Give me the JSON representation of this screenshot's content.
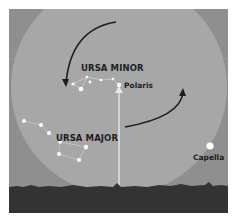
{
  "diagram": {
    "labels": {
      "ursa_minor": "URSA MINOR",
      "ursa_major": "URSA MAJOR",
      "polaris": "Polaris",
      "capella": "Capella"
    },
    "arrows": [
      {
        "name": "counterclockwise-arrow-upper-left",
        "direction": "counterclockwise"
      },
      {
        "name": "counterclockwise-arrow-lower-right",
        "direction": "counterclockwise"
      }
    ],
    "colors": {
      "sky": "#8f8f8f",
      "circumpolar_circle": "#a7a7a7",
      "ground": "#333333",
      "stars": "#ffffff",
      "arrows": "#1e1e1e",
      "text": "#1e1e1e"
    }
  }
}
